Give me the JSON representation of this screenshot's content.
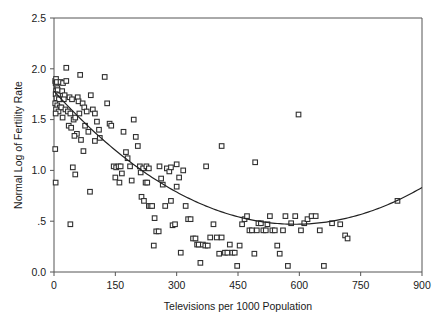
{
  "chart_data": {
    "type": "scatter",
    "title": "",
    "xlabel": "Televisions per 1000 Population",
    "ylabel": "Normal Log of Fertility Rate",
    "xlim": [
      0,
      900
    ],
    "ylim": [
      0.0,
      2.5
    ],
    "grid": false,
    "legend": "none",
    "xticks": [
      0,
      150,
      300,
      450,
      600,
      750,
      900
    ],
    "xtick_labels": [
      "0",
      "150",
      "300",
      "450",
      "600",
      "750",
      "900"
    ],
    "yticks": [
      0.0,
      0.5,
      1.0,
      1.5,
      2.0,
      2.5
    ],
    "ytick_labels": [
      "0.0",
      ".5",
      "1.0",
      "1.5",
      "2.0",
      "2.5"
    ],
    "marker": "open-square",
    "marker_size": 4.6,
    "series": [
      {
        "name": "Countries",
        "points": [
          [
            3,
            1.88
          ],
          [
            4,
            1.86
          ],
          [
            5,
            1.9
          ],
          [
            6,
            1.83
          ],
          [
            7,
            1.87
          ],
          [
            8,
            1.81
          ],
          [
            5,
            1.78
          ],
          [
            9,
            1.79
          ],
          [
            4,
            1.75
          ],
          [
            10,
            1.74
          ],
          [
            6,
            1.71
          ],
          [
            12,
            1.7
          ],
          [
            3,
            1.66
          ],
          [
            8,
            1.64
          ],
          [
            14,
            1.62
          ],
          [
            5,
            1.6
          ],
          [
            11,
            1.58
          ],
          [
            4,
            1.56
          ],
          [
            16,
            1.87
          ],
          [
            22,
            1.86
          ],
          [
            20,
            1.78
          ],
          [
            26,
            1.74
          ],
          [
            30,
            1.88
          ],
          [
            24,
            1.7
          ],
          [
            18,
            1.62
          ],
          [
            28,
            1.6
          ],
          [
            34,
            1.58
          ],
          [
            21,
            1.52
          ],
          [
            30,
            2.01
          ],
          [
            38,
            1.72
          ],
          [
            44,
            1.7
          ],
          [
            40,
            1.56
          ],
          [
            48,
            1.5
          ],
          [
            36,
            1.44
          ],
          [
            42,
            1.42
          ],
          [
            52,
            1.52
          ],
          [
            58,
            1.72
          ],
          [
            60,
            1.68
          ],
          [
            64,
            1.94
          ],
          [
            62,
            1.56
          ],
          [
            56,
            1.36
          ],
          [
            50,
            1.34
          ],
          [
            66,
            1.3
          ],
          [
            70,
            1.66
          ],
          [
            74,
            1.62
          ],
          [
            80,
            1.58
          ],
          [
            76,
            1.44
          ],
          [
            84,
            1.38
          ],
          [
            90,
            1.74
          ],
          [
            95,
            1.6
          ],
          [
            100,
            1.56
          ],
          [
            105,
            1.48
          ],
          [
            110,
            1.4
          ],
          [
            3,
            1.21
          ],
          [
            4,
            0.88
          ],
          [
            46,
            1.03
          ],
          [
            52,
            0.96
          ],
          [
            40,
            0.47
          ],
          [
            88,
            0.79
          ],
          [
            72,
            1.19
          ],
          [
            100,
            1.29
          ],
          [
            112,
            1.32
          ],
          [
            124,
            1.92
          ],
          [
            130,
            1.66
          ],
          [
            136,
            1.46
          ],
          [
            140,
            1.44
          ],
          [
            146,
            1.04
          ],
          [
            152,
            1.03
          ],
          [
            150,
            0.93
          ],
          [
            158,
            1.04
          ],
          [
            163,
            1.04
          ],
          [
            166,
            0.97
          ],
          [
            160,
            0.88
          ],
          [
            170,
            1.38
          ],
          [
            176,
            1.18
          ],
          [
            180,
            1.12
          ],
          [
            186,
            1.04
          ],
          [
            190,
            0.9
          ],
          [
            195,
            1.5
          ],
          [
            200,
            1.33
          ],
          [
            205,
            1.24
          ],
          [
            210,
            1.04
          ],
          [
            214,
            0.74
          ],
          [
            220,
            0.7
          ],
          [
            224,
            0.88
          ],
          [
            228,
            0.88
          ],
          [
            232,
            0.65
          ],
          [
            236,
            0.65
          ],
          [
            240,
            0.65
          ],
          [
            246,
            0.53
          ],
          [
            250,
            0.4
          ],
          [
            256,
            0.4
          ],
          [
            244,
            0.26
          ],
          [
            212,
            0.98
          ],
          [
            218,
            1.02
          ],
          [
            226,
            1.04
          ],
          [
            232,
            1.02
          ],
          [
            258,
            1.04
          ],
          [
            262,
            0.92
          ],
          [
            266,
            0.86
          ],
          [
            272,
            0.65
          ],
          [
            276,
            1.02
          ],
          [
            282,
            0.99
          ],
          [
            286,
            1.03
          ],
          [
            290,
            0.46
          ],
          [
            296,
            0.47
          ],
          [
            300,
            0.84
          ],
          [
            306,
            0.93
          ],
          [
            310,
            0.19
          ],
          [
            316,
            1.0
          ],
          [
            322,
            0.65
          ],
          [
            328,
            0.52
          ],
          [
            334,
            0.52
          ],
          [
            340,
            0.33
          ],
          [
            346,
            0.33
          ],
          [
            350,
            0.27
          ],
          [
            354,
            0.27
          ],
          [
            358,
            0.09
          ],
          [
            364,
            0.27
          ],
          [
            370,
            0.26
          ],
          [
            376,
            0.26
          ],
          [
            382,
            0.34
          ],
          [
            390,
            0.47
          ],
          [
            398,
            0.34
          ],
          [
            404,
            0.18
          ],
          [
            410,
            0.34
          ],
          [
            418,
            0.19
          ],
          [
            424,
            0.19
          ],
          [
            430,
            0.27
          ],
          [
            436,
            0.19
          ],
          [
            442,
            0.19
          ],
          [
            448,
            0.06
          ],
          [
            454,
            0.26
          ],
          [
            460,
            0.47
          ],
          [
            466,
            0.52
          ],
          [
            472,
            0.55
          ],
          [
            478,
            0.41
          ],
          [
            484,
            0.41
          ],
          [
            490,
            0.18
          ],
          [
            496,
            0.41
          ],
          [
            500,
            0.48
          ],
          [
            506,
            0.48
          ],
          [
            512,
            0.41
          ],
          [
            518,
            0.41
          ],
          [
            522,
            0.47
          ],
          [
            528,
            0.55
          ],
          [
            534,
            0.41
          ],
          [
            540,
            0.41
          ],
          [
            546,
            0.26
          ],
          [
            552,
            0.18
          ],
          [
            560,
            0.41
          ],
          [
            566,
            0.55
          ],
          [
            572,
            0.06
          ],
          [
            580,
            0.48
          ],
          [
            590,
            0.55
          ],
          [
            598,
            1.55
          ],
          [
            604,
            0.41
          ],
          [
            612,
            0.48
          ],
          [
            620,
            0.52
          ],
          [
            630,
            0.55
          ],
          [
            640,
            0.55
          ],
          [
            650,
            0.41
          ],
          [
            660,
            0.06
          ],
          [
            680,
            0.48
          ],
          [
            700,
            0.47
          ],
          [
            712,
            0.36
          ],
          [
            718,
            0.33
          ],
          [
            840,
            0.7
          ],
          [
            410,
            1.24
          ],
          [
            492,
            1.08
          ],
          [
            372,
            1.04
          ],
          [
            300,
            1.06
          ],
          [
            286,
            0.7
          ]
        ]
      }
    ],
    "fit_curve": {
      "name": "quadratic-fit",
      "kind": "quadratic",
      "vertex_x": 590,
      "vertex_y": 0.47,
      "y_at_x0": 1.78,
      "y_at_x900": 0.89
    }
  },
  "axes": {
    "x_title": "Televisions per 1000 Population",
    "y_title": "Normal Log of Fertility Rate"
  }
}
